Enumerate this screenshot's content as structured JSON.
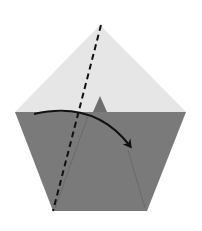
{
  "diagram": {
    "type": "origami-step",
    "shape": "pentagon",
    "colors": {
      "background": "#ffffff",
      "paper_top": "#e6e6e6",
      "paper_bottom": "#7a7a7a",
      "peak": "#6e6e6e",
      "crease": "#666666",
      "fold_line": "#111111",
      "arrow": "#111111"
    },
    "pentagon_points": {
      "top": [
        100,
        25
      ],
      "left": [
        15,
        112
      ],
      "right": [
        186,
        112
      ],
      "bottom_left": [
        53,
        211
      ],
      "bottom_right": [
        147,
        211
      ]
    },
    "elements": {
      "fold_line": {
        "style": "dashed",
        "from": [
          101,
          25
        ],
        "to": [
          53,
          211
        ]
      },
      "arrow": {
        "style": "curved",
        "from": [
          34,
          114
        ],
        "to": [
          130,
          148
        ],
        "direction": "clockwise"
      },
      "peak_flap": {
        "apex": [
          100,
          96
        ],
        "base_left": [
          93,
          112
        ],
        "base_right": [
          107,
          112
        ]
      },
      "crease_left": {
        "from": [
          88,
          116
        ],
        "to": [
          55,
          208
        ]
      },
      "crease_right": {
        "from": [
          128,
          150
        ],
        "to": [
          145,
          208
        ]
      }
    }
  }
}
